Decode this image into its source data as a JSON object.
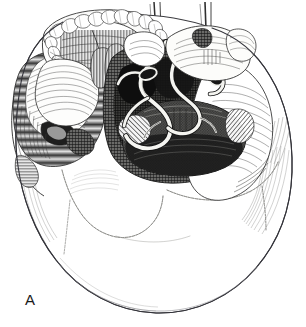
{
  "figure": {
    "type": "anatomical-line-illustration",
    "technique": "pen-and-ink engraving, hatching and stippling",
    "panel_label": "A",
    "width": 306,
    "height": 327,
    "background_color": "#ffffff",
    "ink_color": "#1a1a1a"
  },
  "palette": {
    "background": "#ffffff",
    "ink": "#1a1a1a",
    "ink_light": "#6f6f6f",
    "ink_mid": "#4a4a4a",
    "bone_light": "#fbfbfa",
    "bone_shade": "#cfcfcc",
    "cavity_dark": "#3a3a38",
    "cavity_deep": "#1e1e1d",
    "outline": "#55555a"
  },
  "structures": [
    {
      "name": "cranial-vault",
      "label": "Cranial vault (occipital and parietal bones)",
      "region": "lower two thirds",
      "shading": "mostly unshaded white bone with faint marginal hatching"
    },
    {
      "name": "maxillary-dental-arch",
      "label": "Maxillary dental arch with teeth",
      "region": "top left",
      "tooth_count": 14
    },
    {
      "name": "hard-palate",
      "label": "Hard palate",
      "region": "upper left centre",
      "shading": "fine parallel hatching"
    },
    {
      "name": "zygomatic-arch-left",
      "label": "Zygomatic arch and temporal fossa",
      "region": "left lateral",
      "shading": "dense horizontal hatching"
    },
    {
      "name": "foramen-magnum",
      "label": "Foramen magnum",
      "region": "centre right",
      "shading": "dark oval cavity with stipple"
    },
    {
      "name": "occipital-condyles",
      "label": "Occipital condyles",
      "region": "flanking foramen magnum"
    },
    {
      "name": "cranial-nerves",
      "label": "Cranial nerve and vessel trunks",
      "region": "centre",
      "shading": "pale sinuous bands over dark cavity"
    },
    {
      "name": "sphenoid-body",
      "label": "Sphenoid body and pterygoid plates",
      "region": "upper centre right"
    },
    {
      "name": "cut-vessel-stubs",
      "label": "Severed vessel / nerve stubs",
      "region": "top",
      "count": 2
    },
    {
      "name": "mastoid-process-right",
      "label": "Mastoid process",
      "region": "right lateral"
    },
    {
      "name": "lambdoid-suture",
      "label": "Lambdoid suture",
      "region": "right lower",
      "shading": "serrated thin line"
    },
    {
      "name": "occipitomastoid-suture",
      "label": "Occipitomastoid suture",
      "region": "left lower",
      "shading": "serrated thin line"
    }
  ]
}
